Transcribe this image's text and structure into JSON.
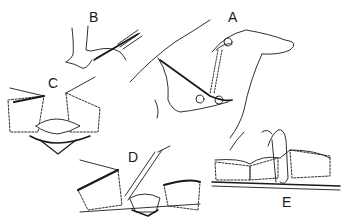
{
  "figure": {
    "panels": [
      {
        "id": "A",
        "label": "A",
        "description": "hands retracting skin with scissors/clamp, dotted incision line"
      },
      {
        "id": "B",
        "label": "B",
        "description": "scalpel incising skin held by fingers"
      },
      {
        "id": "C",
        "label": "C",
        "description": "wound edges retracted by hooks exposing cyst"
      },
      {
        "id": "D",
        "label": "D",
        "description": "scissors dissecting cyst from wound base"
      },
      {
        "id": "E",
        "label": "E",
        "description": "suture closure of skin layers"
      }
    ],
    "colors": {
      "ink": "#1a1a1a",
      "background": "#ffffff"
    }
  }
}
